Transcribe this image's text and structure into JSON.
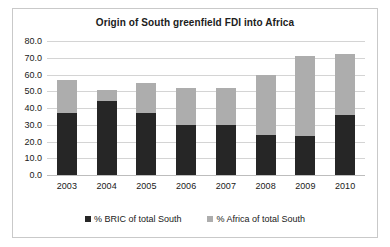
{
  "chart_data": {
    "type": "bar",
    "stacked": true,
    "title": "Origin of South greenfield FDI into Africa",
    "xlabel": "",
    "ylabel": "",
    "categories": [
      "2003",
      "2004",
      "2005",
      "2006",
      "2007",
      "2008",
      "2009",
      "2010"
    ],
    "series": [
      {
        "name": "% BRIC of total South",
        "color": "#262626",
        "values": [
          37,
          44,
          37,
          30,
          30,
          24,
          23,
          36
        ]
      },
      {
        "name": "% Africa of total South",
        "color": "#adadad",
        "values": [
          20,
          7,
          18,
          22,
          22,
          36,
          48,
          36
        ]
      }
    ],
    "totals": [
      57,
      51,
      55,
      52,
      52,
      60,
      71,
      72
    ],
    "ylim": [
      0,
      80
    ],
    "ytick_step": 10,
    "ytick_labels": [
      "0.0",
      "10.0",
      "20.0",
      "30.0",
      "40.0",
      "50.0",
      "60.0",
      "70.0",
      "80.0"
    ],
    "grid": true,
    "legend_position": "bottom"
  },
  "frame": {
    "border_color": "#c9c9c9",
    "background": "#ffffff"
  }
}
